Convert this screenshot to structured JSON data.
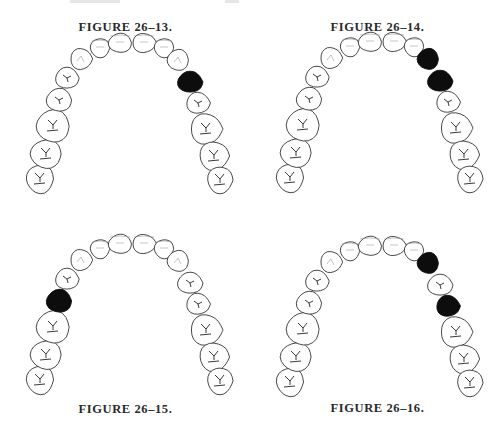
{
  "figures": [
    {
      "label": "FIGURE 26–13.",
      "filled_teeth": [
        "right-first-premolar"
      ],
      "filled_indices": [
        11
      ]
    },
    {
      "label": "FIGURE 26–14.",
      "filled_teeth": [
        "right-canine",
        "right-first-premolar"
      ],
      "filled_indices": [
        10,
        11
      ]
    },
    {
      "label": "FIGURE 26–15.",
      "filled_teeth": [
        "left-second-premolar"
      ],
      "filled_indices": [
        3
      ]
    },
    {
      "label": "FIGURE 26–16.",
      "filled_teeth": [
        "right-canine",
        "right-second-premolar"
      ],
      "filled_indices": [
        10,
        12
      ]
    }
  ],
  "arch": {
    "description": "Occlusal view of maxillary dental arch",
    "teeth": [
      {
        "name": "left-third-molar",
        "type": "molar",
        "x": 38,
        "y": 183,
        "rx": 14,
        "ry": 15
      },
      {
        "name": "left-second-molar",
        "type": "molar",
        "x": 44,
        "y": 158,
        "rx": 16,
        "ry": 15
      },
      {
        "name": "left-first-molar",
        "type": "molar",
        "x": 51,
        "y": 130,
        "rx": 17,
        "ry": 17
      },
      {
        "name": "left-second-premolar",
        "type": "premolar",
        "x": 57,
        "y": 104,
        "rx": 13,
        "ry": 12
      },
      {
        "name": "left-first-premolar",
        "type": "premolar",
        "x": 65,
        "y": 82,
        "rx": 12,
        "ry": 11
      },
      {
        "name": "left-canine",
        "type": "canine",
        "x": 79,
        "y": 63,
        "rx": 11,
        "ry": 11
      },
      {
        "name": "left-lateral-incisor",
        "type": "incisor",
        "x": 98,
        "y": 52,
        "rx": 10,
        "ry": 10
      },
      {
        "name": "left-central-incisor",
        "type": "incisor",
        "x": 118,
        "y": 47,
        "rx": 12,
        "ry": 10
      },
      {
        "name": "right-central-incisor",
        "type": "incisor",
        "x": 142,
        "y": 47,
        "rx": 12,
        "ry": 10
      },
      {
        "name": "right-lateral-incisor",
        "type": "incisor",
        "x": 162,
        "y": 52,
        "rx": 10,
        "ry": 10
      },
      {
        "name": "right-canine",
        "type": "canine",
        "x": 176,
        "y": 64,
        "rx": 11,
        "ry": 11
      },
      {
        "name": "right-first-premolar",
        "type": "premolar",
        "x": 188,
        "y": 86,
        "rx": 13,
        "ry": 11
      },
      {
        "name": "right-second-premolar",
        "type": "premolar",
        "x": 196,
        "y": 107,
        "rx": 12,
        "ry": 11
      },
      {
        "name": "right-first-molar",
        "type": "molar",
        "x": 204,
        "y": 133,
        "rx": 16,
        "ry": 16
      },
      {
        "name": "right-second-molar",
        "type": "molar",
        "x": 212,
        "y": 160,
        "rx": 15,
        "ry": 15
      },
      {
        "name": "right-third-molar",
        "type": "molar",
        "x": 218,
        "y": 184,
        "rx": 13,
        "ry": 14
      }
    ]
  },
  "colors": {
    "filled": "#0d0d0d",
    "outline": "#333333",
    "background": "#ffffff"
  }
}
